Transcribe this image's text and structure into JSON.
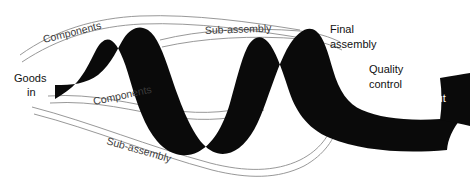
{
  "diagram": {
    "type": "process-flow-ribbon",
    "background_color": "#ffffff",
    "ribbon_color": "#0a0a0a",
    "feeder_line_color": "#8c8c8c",
    "label_color": "#111111",
    "label_color_inverse": "#ffffff",
    "canvas": {
      "width": 470,
      "height": 187
    }
  },
  "labels": {
    "goods_in": {
      "line1": "Goods",
      "line2": "in",
      "x": 14,
      "y": 82,
      "rotation": 0,
      "color": "#111111"
    },
    "components_top": {
      "text": "Components",
      "x": 44,
      "y": 43,
      "rotation": -14,
      "color": "#2a2a2a"
    },
    "components_bottom": {
      "text": "Components",
      "x": 94,
      "y": 105,
      "rotation": -12,
      "color": "#2a2a2a"
    },
    "subassembly_top": {
      "text": "Sub-assembly",
      "x": 205,
      "y": 34,
      "rotation": -2,
      "color": "#2a2a2a"
    },
    "subassembly_bottom": {
      "text": "Sub-assembly",
      "x": 106,
      "y": 144,
      "rotation": 16,
      "color": "#2a2a2a"
    },
    "final_assembly": {
      "line1": "Final",
      "line2": "assembly",
      "x": 330,
      "y": 28,
      "rotation": 0,
      "color": "#111111"
    },
    "quality_control": {
      "line1": "Quality",
      "line2": "control",
      "x": 369,
      "y": 68,
      "rotation": 0,
      "color": "#111111"
    },
    "goods_out": {
      "text": "Goods out",
      "x": 395,
      "y": 99,
      "rotation": 0,
      "color": "#ffffff"
    }
  },
  "flow": {
    "nodes": [
      {
        "id": "goods-in",
        "label": "Goods in",
        "stage": "input"
      },
      {
        "id": "components-1",
        "label": "Components",
        "stage": "feed"
      },
      {
        "id": "components-2",
        "label": "Components",
        "stage": "feed"
      },
      {
        "id": "subassembly-1",
        "label": "Sub-assembly",
        "stage": "feed"
      },
      {
        "id": "subassembly-2",
        "label": "Sub-assembly",
        "stage": "feed"
      },
      {
        "id": "final-assembly",
        "label": "Final assembly",
        "stage": "process"
      },
      {
        "id": "quality-control",
        "label": "Quality control",
        "stage": "process"
      },
      {
        "id": "goods-out",
        "label": "Goods out",
        "stage": "output"
      }
    ]
  }
}
